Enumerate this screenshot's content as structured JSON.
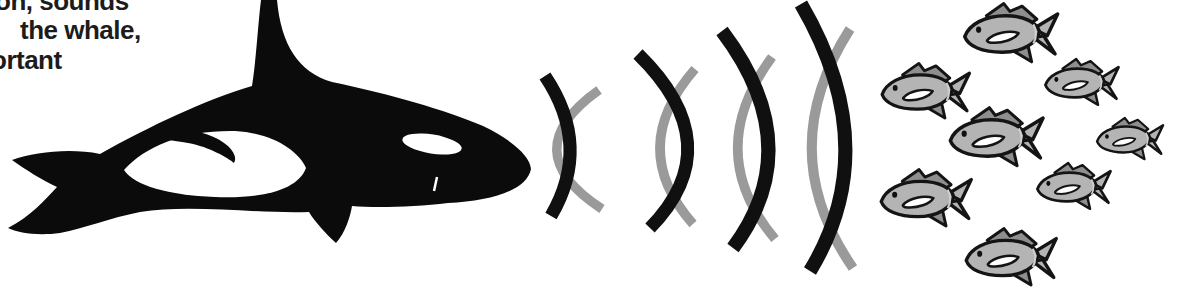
{
  "illustration": {
    "name": "whale-echolocation-diagram",
    "caption_fragments": {
      "line1": "on, sounds",
      "line2": "the whale,",
      "line3": "ortant"
    },
    "whale": {
      "type": "orca",
      "facing": "right"
    },
    "sound_waves": {
      "count": 4,
      "outgoing_color": "#101010",
      "echo_color": "#9a9a9a",
      "arcs": [
        {
          "outgoing": "M 545,76 Q 592,146 551,216",
          "outgoing_width": 13,
          "echo": "M 599,90 Q 513,151 602,209",
          "echo_width": 9.5
        },
        {
          "outgoing": "M 638,54 Q 731,145 650,228",
          "outgoing_width": 13,
          "echo": "M 695,69 Q 626,148 693,224",
          "echo_width": 9.5
        },
        {
          "outgoing": "M 722,31 Q 809,146 733,248",
          "outgoing_width": 14,
          "echo": "M 772,57 Q 702,152 775,239",
          "echo_width": 9.5
        },
        {
          "outgoing": "M 801,4 Q 885,148 810,271",
          "outgoing_width": 14,
          "echo": "M 850,29 Q 772,151 853,268",
          "echo_width": 10
        }
      ]
    },
    "fish_school": {
      "count": 8,
      "body_color": "#b4b4b4",
      "fin_color": "#8e8e8e",
      "outline_color": "#141414",
      "instances": [
        {
          "x": 960,
          "y": 1,
          "w": 105,
          "h": 66
        },
        {
          "x": 878,
          "y": 61,
          "w": 98,
          "h": 62
        },
        {
          "x": 1042,
          "y": 57,
          "w": 82,
          "h": 52
        },
        {
          "x": 946,
          "y": 105,
          "w": 104,
          "h": 66
        },
        {
          "x": 1094,
          "y": 116,
          "w": 74,
          "h": 47
        },
        {
          "x": 877,
          "y": 167,
          "w": 101,
          "h": 64
        },
        {
          "x": 1034,
          "y": 161,
          "w": 82,
          "h": 52
        },
        {
          "x": 962,
          "y": 226,
          "w": 101,
          "h": 64
        }
      ]
    },
    "colors": {
      "ink": "#0b0b0b",
      "paper": "#ffffff",
      "text": "#1c1c1c"
    }
  }
}
